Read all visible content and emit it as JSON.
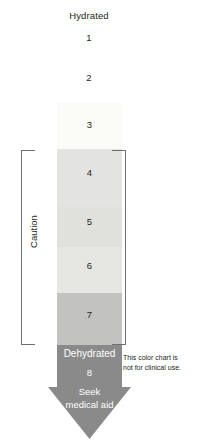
{
  "chart_data": {
    "type": "table",
    "xlabel": "",
    "ylabel": "Hydration level",
    "legend_position": "none",
    "grid": false,
    "categories": [
      "1",
      "2",
      "3",
      "4",
      "5",
      "6",
      "7",
      "8"
    ],
    "values": [
      1,
      2,
      3,
      4,
      5,
      6,
      7,
      8
    ],
    "annotations": [
      "Hydrated",
      "Caution",
      "Dehydrated",
      "Seek medical aid",
      "This color chart is not for clinical use."
    ],
    "series": [
      {
        "name": "Hydration scale swatch colours",
        "values": [
          1,
          2,
          3,
          4,
          5,
          6,
          7,
          8
        ],
        "swatch_colors": [
          "#ffffff",
          "#ffffff",
          "#fbfbf8",
          "#e3e3e1",
          "#e0e0dd",
          "#e6e6e3",
          "#c2c2c0",
          "#8a8a8a"
        ],
        "zone": [
          "hydrated",
          "hydrated",
          "hydrated",
          "caution",
          "caution",
          "caution",
          "caution",
          "dehydrated"
        ]
      }
    ]
  },
  "scale": {
    "hydrated_label": "Hydrated",
    "caution_label": "Caution",
    "steps": [
      {
        "number": "1",
        "color": "#ffffff",
        "in_column": false
      },
      {
        "number": "2",
        "color": "#ffffff",
        "in_column": false
      },
      {
        "number": "3",
        "color": "#fbfbf8",
        "in_column": true,
        "top": 0,
        "height": 46
      },
      {
        "number": "4",
        "color": "#e3e3e1",
        "in_column": true,
        "top": 46,
        "height": 58
      },
      {
        "number": "5",
        "color": "#e0e0dd",
        "in_column": true,
        "top": 104,
        "height": 40
      },
      {
        "number": "6",
        "color": "#e6e6e3",
        "in_column": true,
        "top": 144,
        "height": 46
      },
      {
        "number": "7",
        "color": "#c2c2c0",
        "in_column": true,
        "top": 190,
        "height": 52
      }
    ]
  },
  "arrow": {
    "color": "#8a8a8a",
    "title": "Dehydrated",
    "number": "8",
    "action_line1": "Seek",
    "action_line2": "medical aid"
  },
  "disclaimer": {
    "line1": "This color chart is",
    "line2": "not for clinical use."
  }
}
